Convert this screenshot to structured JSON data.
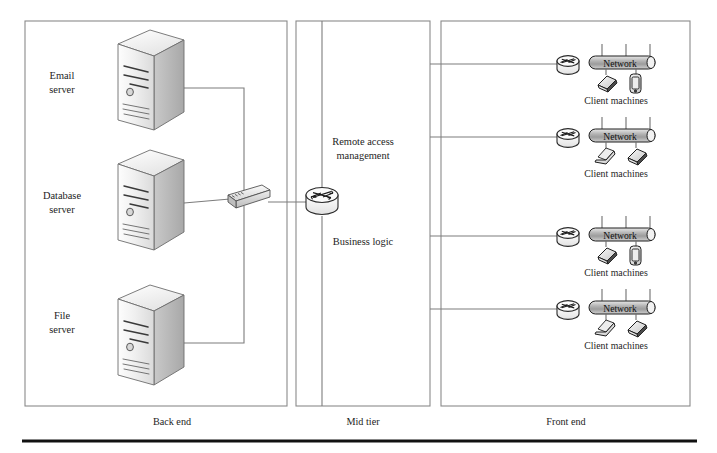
{
  "figure": {
    "background_color": "#ffffff",
    "line_color": "#7d7d7d",
    "panel_stroke": "#8a8a8a",
    "text_color": "#1d1d1d"
  },
  "tiers": [
    {
      "id": "back-end",
      "label": "Back end",
      "label_x": 172,
      "label_y": 425,
      "panel": {
        "x": 25,
        "y": 21,
        "w": 262,
        "h": 385
      }
    },
    {
      "id": "mid-tier",
      "label": "Mid tier",
      "label_x": 363,
      "label_y": 425,
      "panel": {
        "x": 296,
        "y": 21,
        "w": 134,
        "h": 385
      }
    },
    {
      "id": "front-end",
      "label": "Front end",
      "label_x": 566,
      "label_y": 425,
      "panel": {
        "x": 441,
        "y": 21,
        "w": 249,
        "h": 385
      }
    }
  ],
  "servers": [
    {
      "id": "email-server",
      "label_line1": "Email",
      "label_line2": "server",
      "label_x": 62,
      "label_y": 79,
      "icon_x": 110,
      "icon_y": 30
    },
    {
      "id": "database-server",
      "label_line1": "Database",
      "label_line2": "server",
      "label_x": 62,
      "label_y": 199,
      "icon_x": 110,
      "icon_y": 150
    },
    {
      "id": "file-server",
      "label_line1": "File",
      "label_line2": "server",
      "label_x": 62,
      "label_y": 319,
      "icon_x": 110,
      "icon_y": 285
    }
  ],
  "mid_tier_nodes": [
    {
      "id": "switch",
      "type": "network-switch",
      "x": 228,
      "y": 186
    },
    {
      "id": "core-router",
      "type": "router",
      "x": 306,
      "y": 199
    }
  ],
  "mid_tier_labels": [
    {
      "id": "remote-access-management",
      "line1": "Remote access",
      "line2": "management",
      "x": 363,
      "y": 145
    },
    {
      "id": "business-logic",
      "line1": "Business logic",
      "line2": "",
      "x": 363,
      "y": 245
    }
  ],
  "network_bar_label": "Network",
  "client_group_label": "Client machines",
  "client_clusters": [
    {
      "id": "cluster-1",
      "router_x": 568,
      "bar_x": 589,
      "bar_y": 56,
      "devices": [
        "laptop",
        "phone"
      ],
      "caption_x": 616,
      "caption_y": 104
    },
    {
      "id": "cluster-2",
      "router_x": 568,
      "bar_x": 589,
      "bar_y": 129,
      "devices": [
        "laptop-open",
        "laptop"
      ],
      "caption_x": 616,
      "caption_y": 177
    },
    {
      "id": "cluster-3",
      "router_x": 568,
      "bar_x": 589,
      "bar_y": 228,
      "devices": [
        "laptop",
        "phone"
      ],
      "caption_x": 616,
      "caption_y": 276
    },
    {
      "id": "cluster-4",
      "router_x": 568,
      "bar_x": 589,
      "bar_y": 301,
      "devices": [
        "laptop-open",
        "laptop"
      ],
      "caption_x": 616,
      "caption_y": 349
    }
  ],
  "footer_rule": {
    "x1": 22,
    "x2": 697,
    "y": 441,
    "color": "#111111"
  }
}
